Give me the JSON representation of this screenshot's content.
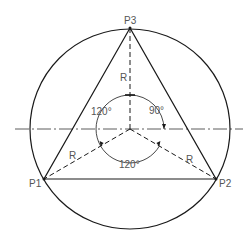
{
  "diagram": {
    "colors": {
      "line": "#1a1a1a",
      "text": "#555555",
      "center_line": "#333333"
    },
    "points": {
      "p1": {
        "label": "P1"
      },
      "p2": {
        "label": "P2"
      },
      "p3": {
        "label": "P3"
      }
    },
    "radius_labels": {
      "top": "R",
      "left": "R",
      "right": "R"
    },
    "angles": {
      "left": "120°",
      "right": "90°",
      "bottom": "120°"
    }
  }
}
